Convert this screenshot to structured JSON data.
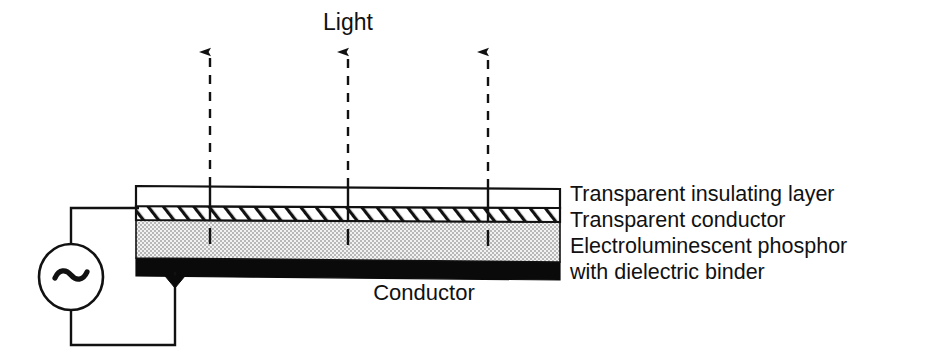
{
  "figure": {
    "colors": {
      "stroke": "#111111",
      "background": "#ffffff",
      "insulating_layer_fill": "#ffffff",
      "conductor_hatch_fill": "#ffffff",
      "phosphor_fill": "#e8e8e8",
      "phosphor_dot": "#9a9a9a",
      "bottom_conductor_fill": "#0a0a0a"
    }
  },
  "light": {
    "label": "Light",
    "arrow_count": 3,
    "arrow_x_positions": [
      210,
      348,
      488
    ],
    "arrow_tip_y": 40,
    "direction": "up",
    "line_style": "dashed"
  },
  "stack": {
    "left_x": 136,
    "right_x": 560,
    "tilt_px": 3,
    "layers": [
      {
        "name": "transparent-insulating-layer",
        "label": "Transparent insulating layer",
        "fill": "white",
        "top_y_left": 186,
        "bottom_y_left": 206
      },
      {
        "name": "transparent-conductor",
        "label": "Transparent conductor",
        "fill": "hatched",
        "top_y_left": 206,
        "bottom_y_left": 220
      },
      {
        "name": "electroluminescent-phosphor",
        "label": "Electroluminescent phosphor",
        "label_line2": "with dielectric binder",
        "fill": "stippled",
        "top_y_left": 220,
        "bottom_y_left": 258
      },
      {
        "name": "bottom-conductor",
        "label": "Conductor",
        "fill": "black",
        "top_y_left": 258,
        "bottom_y_left": 276
      }
    ]
  },
  "labels": {
    "right_column_x": 570,
    "line1": "Transparent insulating layer",
    "line2": "Transparent conductor",
    "line3": "Electroluminescent phosphor",
    "line4": "with dielectric binder",
    "conductor": "Conductor"
  },
  "source": {
    "name": "ac-voltage-source",
    "symbol": "~",
    "center_x": 71,
    "center_y": 277,
    "radius_x": 32,
    "radius_y": 33,
    "top_wire_y": 208,
    "bottom_wire_y": 345,
    "contact_x": 175
  }
}
